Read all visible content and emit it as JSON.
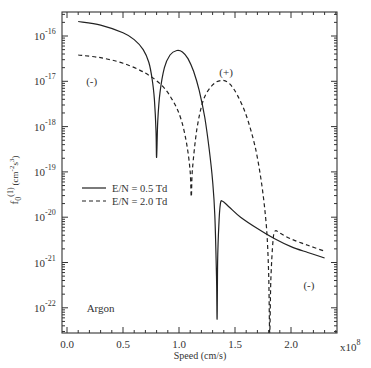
{
  "chart_data": {
    "type": "line",
    "title": "",
    "xlabel": "Speed (cm/s)",
    "ylabel": "f0(1) (cm^-2 s^3)",
    "ylabel_parts": {
      "base": "f",
      "sub": "0",
      "sup": "(1)",
      "units": "(cm",
      "units_exp1": "-2",
      "units_s": "s",
      "units_exp2": "3",
      "units_close": ")"
    },
    "x_multiplier": "x10",
    "x_multiplier_exp": "8",
    "xlim": [
      0.0,
      2.41
    ],
    "ylim_log10": [
      -22.55,
      -15.47
    ],
    "yscale": "log",
    "x_ticks": [
      {
        "value": 0.0,
        "label": "0.0"
      },
      {
        "value": 0.5,
        "label": "0.5"
      },
      {
        "value": 1.0,
        "label": "1.0"
      },
      {
        "value": 1.5,
        "label": "1.5"
      },
      {
        "value": 2.0,
        "label": "2.0"
      }
    ],
    "y_ticks": [
      {
        "exp": -16,
        "label_base": "10",
        "label_exp": "-16"
      },
      {
        "exp": -17,
        "label_base": "10",
        "label_exp": "-17"
      },
      {
        "exp": -18,
        "label_base": "10",
        "label_exp": "-18"
      },
      {
        "exp": -19,
        "label_base": "10",
        "label_exp": "-19"
      },
      {
        "exp": -20,
        "label_base": "10",
        "label_exp": "-20"
      },
      {
        "exp": -21,
        "label_base": "10",
        "label_exp": "-21"
      },
      {
        "exp": -22,
        "label_base": "10",
        "label_exp": "-22"
      }
    ],
    "series": [
      {
        "name": "E/N = 0.5 Td",
        "style": "solid",
        "x": [
          0.1,
          0.3,
          0.5,
          0.6,
          0.68,
          0.73,
          0.76,
          0.78,
          0.795,
          0.8,
          0.81,
          0.83,
          0.87,
          0.92,
          0.98,
          1.03,
          1.08,
          1.13,
          1.18,
          1.23,
          1.27,
          1.3,
          1.32,
          1.335,
          1.34,
          1.345,
          1.355,
          1.37,
          1.39,
          1.45,
          1.55,
          1.7,
          1.85,
          2.0,
          2.15,
          2.3
        ],
        "log10_y": [
          -15.68,
          -15.76,
          -15.93,
          -16.08,
          -16.3,
          -16.58,
          -16.95,
          -17.4,
          -18.1,
          -18.68,
          -17.9,
          -17.25,
          -16.7,
          -16.42,
          -16.32,
          -16.35,
          -16.5,
          -16.78,
          -17.2,
          -17.8,
          -18.5,
          -19.2,
          -19.95,
          -21.3,
          -22.25,
          -21.0,
          -20.2,
          -19.7,
          -19.65,
          -19.78,
          -20.0,
          -20.25,
          -20.47,
          -20.65,
          -20.78,
          -20.9
        ]
      },
      {
        "name": "E/N = 2.0 Td",
        "style": "dashed",
        "x": [
          0.1,
          0.3,
          0.5,
          0.7,
          0.85,
          0.95,
          1.02,
          1.07,
          1.1,
          1.11,
          1.12,
          1.16,
          1.22,
          1.3,
          1.38,
          1.45,
          1.52,
          1.6,
          1.68,
          1.74,
          1.78,
          1.8,
          1.81,
          1.82,
          1.84,
          1.86,
          1.9,
          2.0,
          2.15,
          2.3
        ],
        "log10_y": [
          -16.42,
          -16.48,
          -16.6,
          -16.82,
          -17.1,
          -17.45,
          -17.85,
          -18.4,
          -19.0,
          -19.55,
          -18.95,
          -18.05,
          -17.4,
          -17.08,
          -16.98,
          -17.05,
          -17.3,
          -17.75,
          -18.45,
          -19.3,
          -20.2,
          -21.2,
          -22.55,
          -21.4,
          -20.5,
          -20.3,
          -20.35,
          -20.48,
          -20.62,
          -20.75
        ]
      }
    ],
    "legend": {
      "position": "left-middle",
      "entries": [
        {
          "label": "E/N = 0.5 Td",
          "style": "solid"
        },
        {
          "label": "E/N = 2.0 Td",
          "style": "dashed"
        }
      ]
    },
    "annotations": [
      {
        "text": "(-)",
        "x": 0.22,
        "log10_y": -17.0
      },
      {
        "text": "(+)",
        "x": 1.42,
        "log10_y": -16.8
      },
      {
        "text": "(-)",
        "x": 2.16,
        "log10_y": -21.5
      },
      {
        "text": "Argon",
        "x": 0.3,
        "log10_y": -22.0
      }
    ],
    "grid": false
  }
}
